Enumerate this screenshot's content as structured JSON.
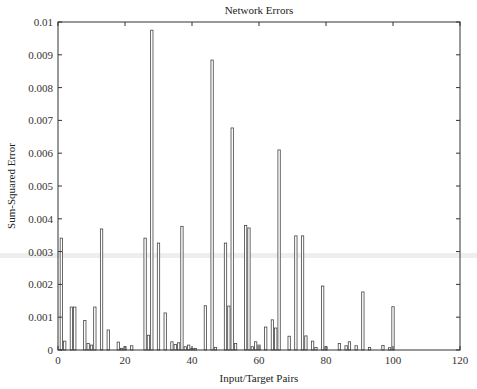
{
  "chart_data": {
    "type": "bar",
    "title": "Network Errors",
    "xlabel": "Input/Target Pairs",
    "ylabel": "Sum-Squared Error",
    "xlim": [
      0,
      120
    ],
    "ylim": [
      0,
      0.01
    ],
    "xticks": [
      0,
      20,
      40,
      60,
      80,
      100,
      120
    ],
    "xtick_labels": [
      "0",
      "20",
      "40",
      "60",
      "80",
      "100",
      "120"
    ],
    "yticks": [
      0,
      0.001,
      0.002,
      0.003,
      0.004,
      0.005,
      0.006,
      0.007,
      0.008,
      0.009,
      0.01
    ],
    "ytick_labels": [
      "0",
      "0.001",
      "0.002",
      "0.003",
      "0.004",
      "0.005",
      "0.006",
      "0.007",
      "0.008",
      "0.009",
      "0.01"
    ],
    "grid": false,
    "legend": null,
    "x": [
      1,
      2,
      4,
      5,
      8,
      9,
      10,
      11,
      13,
      15,
      18,
      19,
      20,
      22,
      26,
      27,
      28,
      30,
      32,
      34,
      35,
      36,
      37,
      38,
      39,
      40,
      41,
      44,
      46,
      47,
      50,
      51,
      52,
      53,
      56,
      57,
      58,
      59,
      60,
      62,
      64,
      65,
      66,
      69,
      71,
      73,
      74,
      76,
      77,
      79,
      80,
      84,
      86,
      87,
      89,
      91,
      93,
      97,
      99,
      100
    ],
    "values": [
      0.00341,
      0.00027,
      0.00131,
      0.00131,
      0.0009,
      0.0002,
      0.00015,
      0.00131,
      0.00369,
      0.00061,
      0.00024,
      5e-05,
      0.0001,
      0.00013,
      0.00341,
      0.00045,
      0.00975,
      0.00326,
      0.00113,
      0.00025,
      0.00017,
      0.00022,
      0.00377,
      0.0001,
      0.00015,
      5e-05,
      5e-05,
      0.00135,
      0.00884,
      8e-05,
      0.00326,
      0.00134,
      0.00677,
      0.0002,
      0.0038,
      0.00372,
      0.0001,
      0.00025,
      0.00015,
      0.0007,
      0.00092,
      0.00067,
      0.0061,
      0.00042,
      0.00348,
      0.00348,
      0.00043,
      0.00027,
      8e-05,
      0.00195,
      0.0001,
      0.0002,
      0.00013,
      0.00025,
      0.00013,
      0.00177,
      8e-05,
      0.00014,
      7e-05,
      0.00132
    ]
  },
  "colors": {
    "axis": "#333333",
    "bar_stroke": "#444444",
    "bar_fill": "#ffffff",
    "scan_band": "#e6e6e6"
  }
}
